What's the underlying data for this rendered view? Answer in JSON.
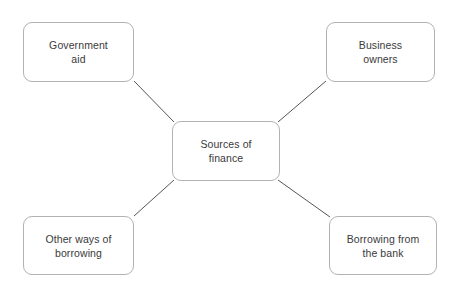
{
  "diagram": {
    "title": "Sources of finance",
    "type": "spider-mind-map",
    "background_color": "#ffffff",
    "border_color": "#b2b2b2",
    "text_color": "#3a3a3a",
    "connector_color": "#555555",
    "center": {
      "id": "center",
      "label": "Sources of\nfinance"
    },
    "branches": [
      {
        "id": "government-aid",
        "label": "Government\naid",
        "position": "top-left"
      },
      {
        "id": "business-owners",
        "label": "Business\nowners",
        "position": "top-right"
      },
      {
        "id": "other-borrowing",
        "label": "Other ways of\nborrowing",
        "position": "bottom-left"
      },
      {
        "id": "bank-borrowing",
        "label": "Borrowing from\nthe bank",
        "position": "bottom-right"
      }
    ],
    "connectors": [
      {
        "id": "connector-center-government-aid",
        "from": "center",
        "to": "government-aid",
        "x1": 134,
        "y1": 81,
        "x2": 174,
        "y2": 122
      },
      {
        "id": "connector-center-business-owners",
        "from": "center",
        "to": "business-owners",
        "x1": 278,
        "y1": 122,
        "x2": 326,
        "y2": 81
      },
      {
        "id": "connector-center-other-borrowing",
        "from": "center",
        "to": "other-borrowing",
        "x1": 174,
        "y1": 180,
        "x2": 134,
        "y2": 216
      },
      {
        "id": "connector-center-bank-borrowing",
        "from": "center",
        "to": "bank-borrowing",
        "x1": 278,
        "y1": 180,
        "x2": 330,
        "y2": 217
      }
    ]
  }
}
